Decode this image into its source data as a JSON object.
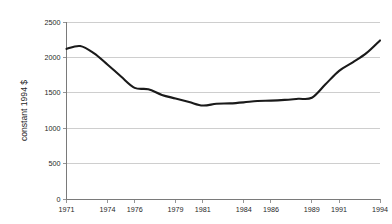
{
  "chart_data": {
    "type": "line",
    "title": "",
    "xlabel": "",
    "ylabel": "constant 1994 $",
    "xlim": [
      1971,
      1994
    ],
    "ylim": [
      0,
      2500
    ],
    "grid": true,
    "legend": false,
    "y_ticks": [
      0,
      500,
      1000,
      1500,
      2000,
      2500
    ],
    "y_tick_labels": [
      "0",
      "500",
      "1000",
      "1500",
      "2000",
      "2500"
    ],
    "x_ticks": [
      1971,
      1974,
      1976,
      1979,
      1981,
      1984,
      1986,
      1989,
      1991,
      1994
    ],
    "x_tick_labels": [
      "1971",
      "1974",
      "1976",
      "1979",
      "1981",
      "1984",
      "1986",
      "1989",
      "1991",
      "1994"
    ],
    "line_color": "#1a1a1a",
    "grid_color": "#b9b9b9",
    "axis_color": "#7a7a7a",
    "series": [
      {
        "name": "constant 1994 $",
        "x": [
          1971,
          1972,
          1973,
          1974,
          1975,
          1976,
          1977,
          1978,
          1979,
          1980,
          1981,
          1982,
          1983,
          1984,
          1985,
          1986,
          1987,
          1988,
          1989,
          1990,
          1991,
          1992,
          1993,
          1994
        ],
        "values": [
          2120,
          2160,
          2060,
          1900,
          1730,
          1570,
          1550,
          1470,
          1420,
          1370,
          1320,
          1345,
          1350,
          1365,
          1385,
          1390,
          1400,
          1415,
          1430,
          1620,
          1810,
          1930,
          2060,
          2240
        ]
      }
    ]
  }
}
